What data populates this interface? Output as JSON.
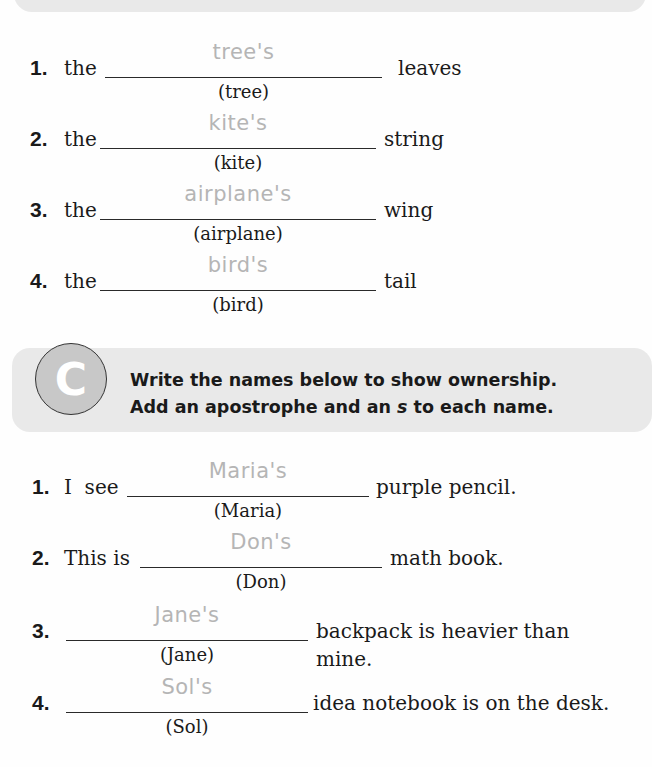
{
  "section_b": {
    "items": [
      {
        "number": "1.",
        "prefix": "the",
        "answer": "tree's",
        "hint": "(tree)",
        "suffix": "leaves"
      },
      {
        "number": "2.",
        "prefix": "the",
        "answer": "kite's",
        "hint": "(kite)",
        "suffix": "string"
      },
      {
        "number": "3.",
        "prefix": "the",
        "answer": "airplane's",
        "hint": "(airplane)",
        "suffix": "wing"
      },
      {
        "number": "4.",
        "prefix": "the",
        "answer": "bird's",
        "hint": "(bird)",
        "suffix": "tail"
      }
    ]
  },
  "section_c": {
    "badge": "C",
    "instruction_line1": "Write the names below to show ownership.",
    "instruction_line2_a": "Add an apostrophe and an ",
    "instruction_line2_s": "s",
    "instruction_line2_b": " to each name.",
    "items": [
      {
        "number": "1.",
        "prefix": "I  see",
        "answer": "Maria's",
        "hint": "(Maria)",
        "suffix": "purple pencil."
      },
      {
        "number": "2.",
        "prefix": "This is",
        "answer": "Don's",
        "hint": "(Don)",
        "suffix": "math book."
      },
      {
        "number": "3.",
        "prefix": "",
        "answer": "Jane's",
        "hint": "(Jane)",
        "suffix": "backpack is heavier than mine."
      },
      {
        "number": "4.",
        "prefix": "",
        "answer": "Sol's",
        "hint": "(Sol)",
        "suffix": "idea notebook is on the desk."
      }
    ]
  }
}
